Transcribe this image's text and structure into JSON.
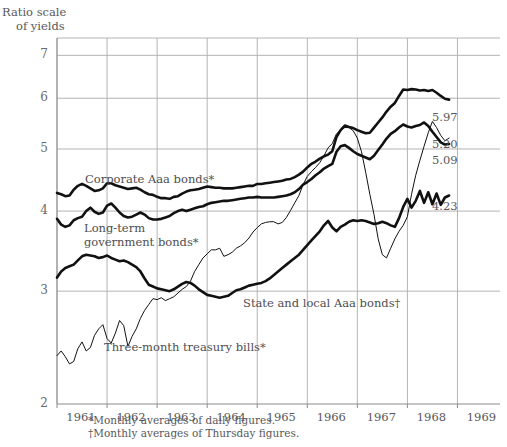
{
  "chart_data": {
    "type": "line",
    "title": "Ratio scale of yields",
    "title_lines": [
      "Ratio scale",
      "of yields"
    ],
    "ylabel": "Ratio scale of yields",
    "xlabel": "",
    "yscale": "log",
    "ylim": [
      2,
      7.45
    ],
    "xlim": [
      1961.0,
      1969.85
    ],
    "yticks": [
      2,
      3,
      4,
      5,
      6,
      7
    ],
    "ytick_labels": [
      "2",
      "3",
      "4",
      "5",
      "6",
      "7"
    ],
    "xticks": [
      1961,
      1962,
      1963,
      1964,
      1965,
      1966,
      1967,
      1968,
      1969
    ],
    "xtick_labels": [
      "1961",
      "1962",
      "1963",
      "1964",
      "1965",
      "1966",
      "1967",
      "1968",
      "1969"
    ],
    "grid": true,
    "grid_axes": "both",
    "legend": "inline-annotations",
    "x_start": 1961.0,
    "x_step": 0.08333,
    "series": [
      {
        "name": "Corporate Aaa bonds*",
        "label": "Corporate Aaa bonds*",
        "footnote_marker": "*",
        "linewidth": "thick",
        "end_label": "5.97",
        "end_value": 5.97,
        "values": [
          4.27,
          4.25,
          4.22,
          4.23,
          4.32,
          4.38,
          4.41,
          4.38,
          4.34,
          4.3,
          4.31,
          4.34,
          4.42,
          4.42,
          4.39,
          4.37,
          4.35,
          4.33,
          4.34,
          4.35,
          4.32,
          4.28,
          4.25,
          4.24,
          4.21,
          4.19,
          4.19,
          4.18,
          4.21,
          4.22,
          4.26,
          4.29,
          4.31,
          4.32,
          4.33,
          4.35,
          4.37,
          4.36,
          4.35,
          4.35,
          4.34,
          4.34,
          4.34,
          4.35,
          4.36,
          4.37,
          4.38,
          4.38,
          4.41,
          4.41,
          4.42,
          4.43,
          4.44,
          4.45,
          4.46,
          4.48,
          4.49,
          4.52,
          4.56,
          4.61,
          4.68,
          4.74,
          4.78,
          4.83,
          4.87,
          4.9,
          4.96,
          5.22,
          5.35,
          5.44,
          5.41,
          5.39,
          5.35,
          5.32,
          5.29,
          5.3,
          5.4,
          5.5,
          5.6,
          5.72,
          5.82,
          5.9,
          6.05,
          6.19,
          6.18,
          6.2,
          6.19,
          6.17,
          6.18,
          6.16,
          6.18,
          6.12,
          6.05,
          5.99,
          5.97
        ]
      },
      {
        "name": "Long-term government bonds*",
        "label": "Long-term\ngovernment bonds*",
        "label_lines": [
          "Long-term",
          "government bonds*"
        ],
        "footnote_marker": "*",
        "linewidth": "thick",
        "end_label": "5.09",
        "end_value": 5.09,
        "values": [
          3.89,
          3.81,
          3.78,
          3.8,
          3.87,
          3.9,
          3.92,
          4.0,
          4.05,
          3.99,
          3.96,
          3.98,
          4.08,
          4.11,
          4.05,
          3.98,
          3.93,
          3.91,
          3.92,
          3.95,
          3.98,
          3.95,
          3.9,
          3.88,
          3.88,
          3.89,
          3.91,
          3.93,
          3.97,
          4.0,
          4.02,
          4.0,
          4.02,
          4.04,
          4.06,
          4.07,
          4.1,
          4.12,
          4.13,
          4.14,
          4.15,
          4.15,
          4.16,
          4.17,
          4.18,
          4.19,
          4.2,
          4.2,
          4.21,
          4.2,
          4.2,
          4.2,
          4.2,
          4.21,
          4.22,
          4.23,
          4.25,
          4.28,
          4.33,
          4.4,
          4.44,
          4.49,
          4.55,
          4.6,
          4.66,
          4.7,
          4.74,
          4.95,
          5.05,
          5.07,
          5.02,
          4.96,
          4.91,
          4.88,
          4.85,
          4.82,
          4.88,
          4.98,
          5.08,
          5.19,
          5.28,
          5.33,
          5.4,
          5.46,
          5.42,
          5.4,
          5.43,
          5.45,
          5.5,
          5.43,
          5.32,
          5.22,
          5.12,
          5.08,
          5.09
        ]
      },
      {
        "name": "State and local Aaa bonds†",
        "label": "State and local Aaa bonds†",
        "footnote_marker": "†",
        "linewidth": "thick",
        "end_label": "4.23",
        "end_value": 4.23,
        "values": [
          3.15,
          3.22,
          3.26,
          3.28,
          3.3,
          3.35,
          3.4,
          3.42,
          3.41,
          3.4,
          3.38,
          3.39,
          3.41,
          3.38,
          3.36,
          3.34,
          3.35,
          3.33,
          3.3,
          3.27,
          3.22,
          3.14,
          3.07,
          3.05,
          3.03,
          3.02,
          3.01,
          3.0,
          3.02,
          3.05,
          3.08,
          3.1,
          3.09,
          3.06,
          3.02,
          2.99,
          2.96,
          2.95,
          2.94,
          2.93,
          2.94,
          2.95,
          2.98,
          3.01,
          3.02,
          3.04,
          3.06,
          3.07,
          3.08,
          3.09,
          3.11,
          3.14,
          3.18,
          3.22,
          3.26,
          3.3,
          3.34,
          3.38,
          3.42,
          3.48,
          3.54,
          3.6,
          3.66,
          3.72,
          3.8,
          3.86,
          3.77,
          3.72,
          3.78,
          3.81,
          3.85,
          3.87,
          3.86,
          3.87,
          3.86,
          3.84,
          3.82,
          3.83,
          3.85,
          3.83,
          3.8,
          3.78,
          3.9,
          4.06,
          4.18,
          4.05,
          4.15,
          4.3,
          4.12,
          4.28,
          4.1,
          4.26,
          4.09,
          4.2,
          4.23
        ]
      },
      {
        "name": "Three-month treasury bills*",
        "label": "Three-month treasury bills*",
        "footnote_marker": "*",
        "linewidth": "thin",
        "end_label": "5.20",
        "end_value": 5.2,
        "values": [
          2.38,
          2.42,
          2.37,
          2.31,
          2.33,
          2.44,
          2.5,
          2.42,
          2.45,
          2.56,
          2.62,
          2.66,
          2.53,
          2.49,
          2.58,
          2.7,
          2.65,
          2.46,
          2.55,
          2.62,
          2.72,
          2.8,
          2.86,
          2.92,
          2.91,
          2.93,
          2.9,
          2.92,
          2.94,
          2.98,
          3.02,
          3.05,
          3.11,
          3.22,
          3.3,
          3.38,
          3.43,
          3.48,
          3.48,
          3.5,
          3.4,
          3.42,
          3.45,
          3.5,
          3.53,
          3.57,
          3.63,
          3.71,
          3.77,
          3.82,
          3.84,
          3.85,
          3.85,
          3.82,
          3.84,
          3.91,
          4.01,
          4.12,
          4.23,
          4.4,
          4.53,
          4.61,
          4.68,
          4.76,
          4.88,
          5.02,
          5.1,
          5.28,
          5.35,
          5.4,
          5.4,
          5.34,
          5.2,
          4.95,
          4.6,
          4.25,
          3.95,
          3.62,
          3.42,
          3.38,
          3.5,
          3.62,
          3.72,
          3.8,
          3.92,
          4.25,
          4.55,
          4.8,
          5.05,
          5.3,
          5.52,
          5.4,
          5.25,
          5.15,
          5.2
        ]
      }
    ]
  },
  "annotations": {
    "corporate_label": "Corporate Aaa bonds*",
    "longterm_label_l1": "Long-term",
    "longterm_label_l2": "government bonds*",
    "state_label": "State and local Aaa bonds†",
    "bills_label": "Three-month treasury bills*",
    "value_5_97": "5.97",
    "value_5_20": "5.20",
    "value_5_09": "5.09",
    "value_4_23": "4.23"
  },
  "footnotes": {
    "line1": "*Monthly averages of daily figures.",
    "line2": "†Monthly averages of Thursday figures."
  },
  "colors": {
    "line": "#111111",
    "grid": "#b4b4b6",
    "axis": "#8c8c8e",
    "text": "#58585a",
    "background": "#ffffff"
  }
}
